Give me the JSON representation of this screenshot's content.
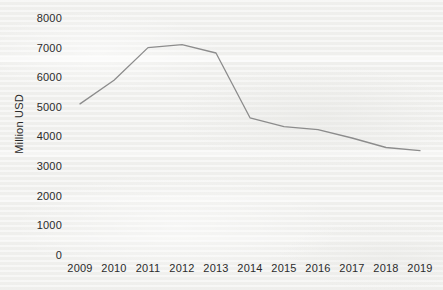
{
  "chart_data": {
    "type": "line",
    "title": "",
    "xlabel": "",
    "ylabel": "Million USD",
    "categories": [
      "2009",
      "2010",
      "2011",
      "2012",
      "2013",
      "2014",
      "2015",
      "2016",
      "2017",
      "2018",
      "2019"
    ],
    "values": [
      5100,
      5900,
      7000,
      7100,
      6820,
      4630,
      4330,
      4230,
      3950,
      3630,
      3520
    ],
    "series": [
      {
        "name": "Million USD",
        "values": [
          5100,
          5900,
          7000,
          7100,
          6820,
          4630,
          4330,
          4230,
          3950,
          3630,
          3520
        ]
      }
    ],
    "ylim": [
      0,
      8000
    ],
    "ytick_labels": [
      "8000",
      "7000",
      "6000",
      "5000",
      "4000",
      "3000",
      "2000",
      "1000",
      "0"
    ],
    "ytick_values": [
      8000,
      7000,
      6000,
      5000,
      4000,
      3000,
      2000,
      1000,
      0
    ],
    "xtick_labels": [
      "2009",
      "2010",
      "2011",
      "2012",
      "2013",
      "2014",
      "2015",
      "2016",
      "2017",
      "2018",
      "2019"
    ],
    "grid": false,
    "legend": "none",
    "line_color": "#8c8c8c",
    "text_color": "#2b2b2b",
    "background_color": "#f1f1ef"
  }
}
